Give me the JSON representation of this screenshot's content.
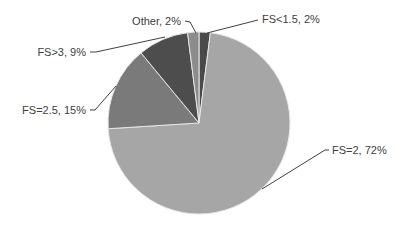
{
  "chart_data": {
    "type": "pie",
    "title": "",
    "start_angle_deg": 0,
    "direction": "clockwise",
    "slices": [
      {
        "label": "FS<1.5",
        "value": 2,
        "color": "#4a4a4a",
        "text": "FS<1.5, 2%"
      },
      {
        "label": "FS=2",
        "value": 72,
        "color": "#a6a6a6",
        "text": "FS=2, 72%"
      },
      {
        "label": "FS=2.5",
        "value": 15,
        "color": "#7a7a7a",
        "text": "FS=2.5, 15%"
      },
      {
        "label": "FS>3",
        "value": 9,
        "color": "#4d4d4d",
        "text": "FS>3, 9%"
      },
      {
        "label": "Other",
        "value": 2,
        "color": "#8c8c8c",
        "text": "Other, 2%"
      }
    ],
    "legend": "none (data labels with leader lines)"
  }
}
